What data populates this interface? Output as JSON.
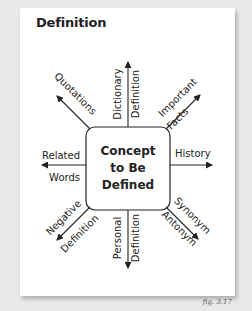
{
  "title": "Definition",
  "center": {
    "line1": "Concept",
    "line2": "to Be",
    "line3": "Defined"
  },
  "branches": {
    "quotations": "Quotations",
    "dictionary_1": "Dictionary",
    "dictionary_2": "Definition",
    "important_1": "Important",
    "important_2": "Facts",
    "related_1": "Related",
    "related_2": "Words",
    "history": "History",
    "negative_1": "Negative",
    "negative_2": "Definition",
    "personal_1": "Personal",
    "personal_2": "Definition",
    "synonym": "Synonym",
    "antonym": "Antonym"
  },
  "caption": "fig. 3.17",
  "colors": {
    "background": "#e9e9e9",
    "card": "#ffffff",
    "ink": "#222222"
  }
}
